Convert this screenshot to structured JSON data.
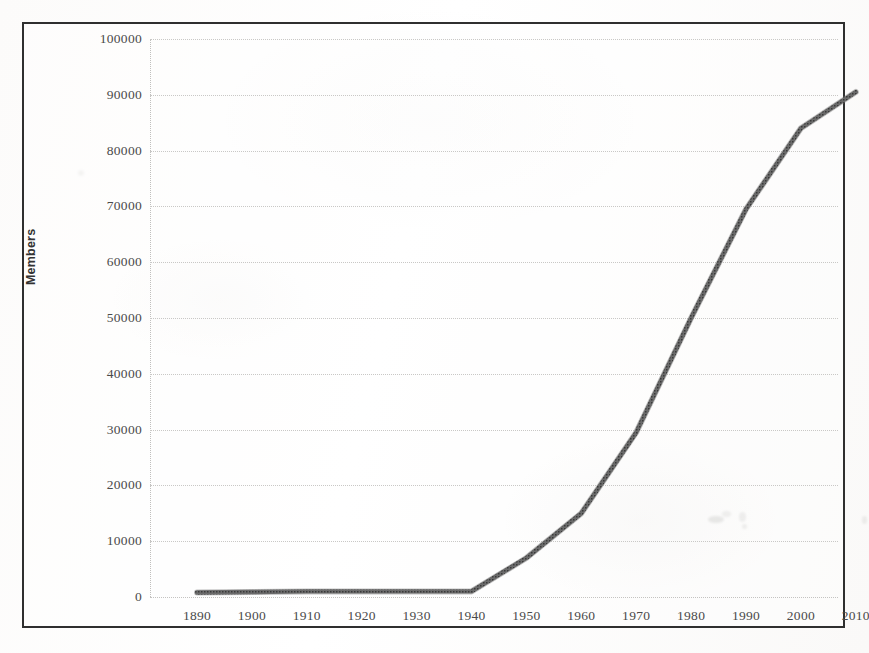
{
  "figure": {
    "frame_color": "#2f2f2f",
    "background": "#fdfdfc",
    "line_color": "#555555",
    "grid_color": "#c9c8c6",
    "axis_title": "Members"
  },
  "chart_data": {
    "type": "line",
    "title": "",
    "subtitle": "",
    "xlabel": "",
    "ylabel": "Members",
    "xlim": [
      1890,
      2010
    ],
    "ylim": [
      0,
      100000
    ],
    "grid": true,
    "legend": null,
    "xtick_labels": [
      "1890",
      "1900",
      "1910",
      "1920",
      "1930",
      "1940",
      "1950",
      "1960",
      "1970",
      "1980",
      "1990",
      "2000",
      "2010"
    ],
    "ytick_labels": [
      "0",
      "10000",
      "20000",
      "30000",
      "40000",
      "50000",
      "60000",
      "70000",
      "80000",
      "90000",
      "100000"
    ],
    "ytick_values": [
      0,
      10000,
      20000,
      30000,
      40000,
      50000,
      60000,
      70000,
      80000,
      90000,
      100000
    ],
    "x": [
      1890,
      1900,
      1910,
      1920,
      1930,
      1940,
      1950,
      1960,
      1970,
      1980,
      1990,
      2000,
      2010
    ],
    "series": [
      {
        "name": "Members",
        "values": [
          800,
          900,
          1000,
          1000,
          1000,
          1000,
          7000,
          15000,
          29500,
          50000,
          69500,
          84000,
          90500
        ]
      }
    ]
  }
}
